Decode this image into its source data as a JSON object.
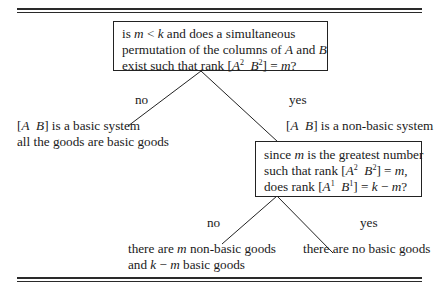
{
  "diagram": {
    "type": "decision-tree",
    "root": {
      "question_lines": [
        "is m < k and does a simultaneous",
        "permutation of the columns of A and B",
        "exist such that rank [A² B²] = m?"
      ],
      "parts": {
        "l1_a": "is ",
        "l1_m": "m",
        "l1_lt": " < ",
        "l1_k": "k",
        "l1_b": " and does a simultaneous",
        "l2_a": "permutation of the columns of ",
        "l2_A": "A",
        "l2_and": " and ",
        "l2_B": "B",
        "l3_a": "exist such that rank [",
        "l3_A": "A",
        "l3_sup1": "2",
        "l3_B": "B",
        "l3_sup2": "2",
        "l3_b": "] = ",
        "l3_m": "m",
        "l3_q": "?"
      }
    },
    "branch_no_1": {
      "label": "no",
      "result_line1": {
        "open": "[",
        "A": "A",
        "B": "B",
        "rest": "] is a basic system"
      },
      "result_line2": "all the goods are basic goods"
    },
    "branch_yes_1": {
      "label": "yes",
      "result_line1": {
        "open": "[",
        "A": "A",
        "B": "B",
        "rest": "] is a non-basic system"
      }
    },
    "node2": {
      "parts": {
        "l1_a": "since ",
        "l1_m": "m",
        "l1_b": " is the greatest number",
        "l2_a": "such that rank [",
        "l2_A": "A",
        "l2_sup1": "2",
        "l2_B": "B",
        "l2_sup2": "2",
        "l2_b": "] = ",
        "l2_m": "m",
        "l2_c": ",",
        "l3_a": "does rank [",
        "l3_A": "A",
        "l3_sup1": "1",
        "l3_B": "B",
        "l3_sup2": "1",
        "l3_b": "] = ",
        "l3_k": "k",
        "l3_minus": " − ",
        "l3_m": "m",
        "l3_q": "?"
      }
    },
    "branch_no_2": {
      "label": "no",
      "result_line1": {
        "a": "there are ",
        "m": "m",
        "b": " non-basic goods"
      },
      "result_line2": {
        "a": "and ",
        "k": "k",
        "minus": " − ",
        "m": "m",
        "b": " basic goods"
      }
    },
    "branch_yes_2": {
      "label": "yes",
      "result": "there are no basic goods"
    }
  },
  "colors": {
    "ink": "#1a1a1a",
    "background": "#ffffff"
  }
}
